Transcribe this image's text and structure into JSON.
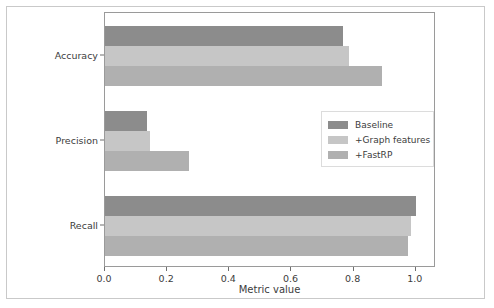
{
  "chart_data": {
    "type": "bar",
    "orientation": "horizontal",
    "title": "",
    "xlabel": "Metric value",
    "ylabel": "",
    "categories": [
      "Accuracy",
      "Precision",
      "Recall"
    ],
    "series": [
      {
        "name": "Baseline",
        "values": [
          0.765,
          0.135,
          1.0
        ],
        "color": "#8c8c8c"
      },
      {
        "name": "+Graph features",
        "values": [
          0.785,
          0.145,
          0.985
        ],
        "color": "#c6c6c6"
      },
      {
        "name": "+FastRP",
        "values": [
          0.89,
          0.27,
          0.975
        ],
        "color": "#b0b0b0"
      }
    ],
    "xlim": [
      0.0,
      1.065
    ],
    "xticks": [
      "0.0",
      "0.2",
      "0.4",
      "0.6",
      "0.8",
      "1.0"
    ],
    "xtick_values": [
      0.0,
      0.2,
      0.4,
      0.6,
      0.8,
      1.0
    ],
    "grid": false,
    "legend_position": "center right",
    "legend_entries": [
      "Baseline",
      "+Graph features",
      "+FastRP"
    ]
  },
  "axes": {
    "x_label": "Metric value"
  },
  "colors": {
    "baseline": "#8c8c8c",
    "graph_features": "#c6c6c6",
    "fastrp": "#b0b0b0",
    "axis_line": "#9a9a9a",
    "text": "#3c3c3c",
    "frame": "#c9c9c9"
  }
}
